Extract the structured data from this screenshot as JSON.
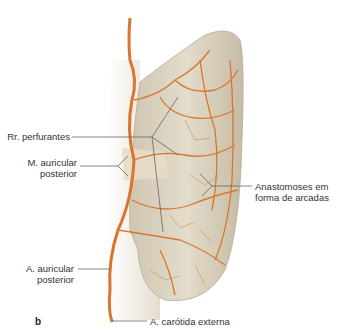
{
  "figure": {
    "panel_letter": "b",
    "colors": {
      "artery": "#d9762e",
      "skin": "#ddd5c3",
      "skin_shadow": "#bfb39c",
      "leader": "#555555"
    },
    "labels": {
      "rr_perfurantes": "Rr. perfurantes",
      "m_auricular_line1": "M. auricular",
      "m_auricular_line2": "posterior",
      "anastomoses_line1": "Anastomoses em",
      "anastomoses_line2": "forma de arcadas",
      "a_auricular_line1": "A. auricular",
      "a_auricular_line2": "posterior",
      "a_carotida": "A. carótida externa"
    }
  }
}
